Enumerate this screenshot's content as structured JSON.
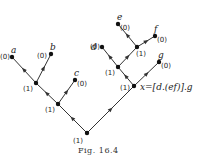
{
  "caption": "Fig. 16.4",
  "expression_label": "x=[d.(ef)].g",
  "nodes": [
    {
      "id": "a",
      "label": "a",
      "weight": "(0)",
      "x": 12,
      "y": 57
    },
    {
      "id": "b",
      "label": "b",
      "weight": "(0)",
      "x": 51,
      "y": 54
    },
    {
      "id": "ab",
      "label": "",
      "weight": "(1)",
      "x": 36,
      "y": 83
    },
    {
      "id": "c",
      "label": "c",
      "weight": "(0)",
      "x": 75,
      "y": 80
    },
    {
      "id": "abc",
      "label": "",
      "weight": "(1)",
      "x": 58,
      "y": 104
    },
    {
      "id": "root",
      "label": "",
      "weight": "(1)",
      "x": 87,
      "y": 133
    },
    {
      "id": "x",
      "label": "",
      "weight": "(1)",
      "x": 134,
      "y": 86
    },
    {
      "id": "g",
      "label": "g",
      "weight": "(0)",
      "x": 159,
      "y": 62
    },
    {
      "id": "def",
      "label": "",
      "weight": "(1)",
      "x": 118,
      "y": 67
    },
    {
      "id": "d",
      "label": "d",
      "weight": "(0)",
      "x": 102,
      "y": 47
    },
    {
      "id": "ef",
      "label": "",
      "weight": "(1)",
      "x": 137,
      "y": 47
    },
    {
      "id": "e",
      "label": "e",
      "weight": "(0)",
      "x": 118,
      "y": 24
    },
    {
      "id": "f",
      "label": "f",
      "weight": "(0)",
      "x": 155,
      "y": 36
    }
  ],
  "edges": [
    [
      "root",
      "abc"
    ],
    [
      "abc",
      "ab"
    ],
    [
      "ab",
      "a"
    ],
    [
      "ab",
      "b"
    ],
    [
      "abc",
      "c"
    ],
    [
      "root",
      "x"
    ],
    [
      "x",
      "g"
    ],
    [
      "x",
      "def"
    ],
    [
      "def",
      "d"
    ],
    [
      "def",
      "ef"
    ],
    [
      "ef",
      "e"
    ],
    [
      "ef",
      "f"
    ]
  ]
}
